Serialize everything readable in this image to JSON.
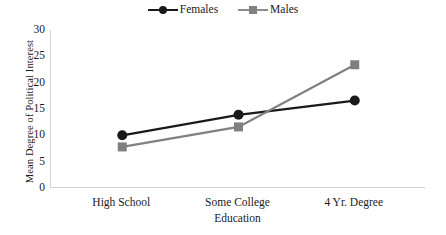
{
  "chart_data": {
    "type": "line",
    "title": "",
    "categories": [
      "High School",
      "Some College",
      "4 Yr. Degree"
    ],
    "series": [
      {
        "name": "Females",
        "values": [
          10.0,
          13.9,
          16.6
        ],
        "color": "#1a1a1a",
        "marker": "circle"
      },
      {
        "name": "Males",
        "values": [
          7.8,
          11.6,
          23.4
        ],
        "color": "#808080",
        "marker": "square"
      }
    ],
    "xlabel": "Education",
    "ylabel": "Mean Degree of Political Interest",
    "ylim": [
      0,
      30
    ],
    "yticks": [
      0,
      5,
      10,
      15,
      20,
      25,
      30
    ],
    "ytick_labels": [
      "0",
      "5",
      "10",
      "15",
      "20",
      "25",
      "30"
    ],
    "grid": false,
    "legend_position": "top-center"
  },
  "legend": {
    "entries": [
      {
        "label": "Females"
      },
      {
        "label": "Males"
      }
    ]
  },
  "axes": {
    "y_title": "Mean Degree of Political Interest",
    "x_title": "Education"
  }
}
